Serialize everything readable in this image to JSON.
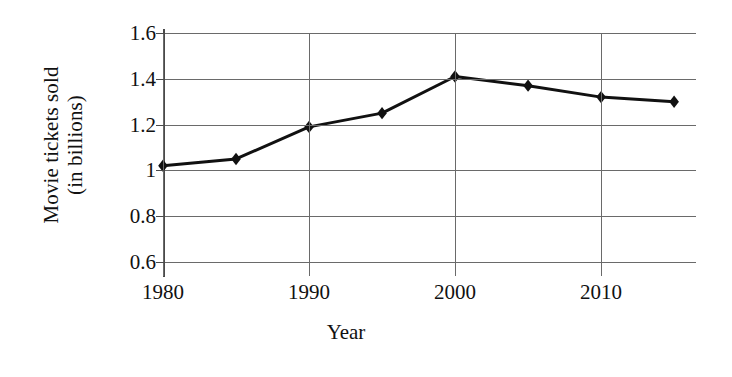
{
  "chart_data": {
    "type": "line",
    "title": "",
    "xlabel": "Year",
    "ylabel": "Movie tickets sold (in billions)",
    "ylabel_line1": "Movie tickets sold",
    "ylabel_line2": "(in billions)",
    "x": [
      1980,
      1985,
      1990,
      1995,
      2000,
      2005,
      2010,
      2015
    ],
    "values": [
      1.02,
      1.05,
      1.19,
      1.25,
      1.41,
      1.37,
      1.32,
      1.3
    ],
    "series": [
      {
        "name": "Movie tickets sold",
        "marker": "diamond",
        "color": "#111111",
        "values": [
          1.02,
          1.05,
          1.19,
          1.25,
          1.41,
          1.37,
          1.32,
          1.3
        ]
      }
    ],
    "xlim": [
      1980,
      2016.5
    ],
    "ylim": [
      0.6,
      1.6
    ],
    "ytick_values": [
      0.6,
      0.8,
      1.0,
      1.2,
      1.4,
      1.6
    ],
    "ytick_labels": [
      "0.6",
      "0.8",
      "1",
      "1.2",
      "1.4",
      "1.6"
    ],
    "xtick_values": [
      1980,
      1990,
      2000,
      2010
    ],
    "xtick_labels": [
      "1980",
      "1990",
      "2000",
      "2010"
    ],
    "grid": {
      "horizontal": true,
      "vertical": true,
      "color": "#6a6a6a"
    },
    "legend": {
      "visible": false,
      "position": "none"
    },
    "line_color": "#111111",
    "line_width": 3,
    "background": "#ffffff"
  }
}
